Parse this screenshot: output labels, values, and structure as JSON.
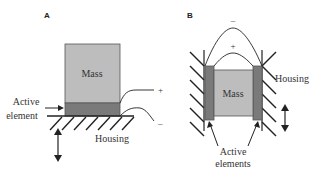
{
  "panels": [
    {
      "id": "A",
      "label": "A",
      "mass_label": "Mass",
      "active_label_line1": "Active",
      "active_label_line2": "element",
      "housing_label": "Housing",
      "plus": "+",
      "minus": "–"
    },
    {
      "id": "B",
      "label": "B",
      "mass_label": "Mass",
      "housing_label": "Housing",
      "active_label_line1": "Active",
      "active_label_line2": "elements",
      "plus": "+",
      "minus": "–"
    }
  ],
  "colors": {
    "mass": "#bdbdbd",
    "active_element": "#7a7a7a",
    "line": "#222222"
  }
}
